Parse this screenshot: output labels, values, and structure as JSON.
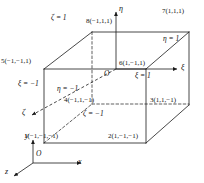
{
  "figure": {
    "type": "hexahedral-element-natural-coordinates",
    "origin_label": "O",
    "global_origin_label": "O"
  },
  "nodes": [
    {
      "id": "1",
      "label": "1(−1,−1,−1)",
      "x": -1,
      "y": -1,
      "z": -1
    },
    {
      "id": "2",
      "label": "2(1,−1,−1)",
      "x": 1,
      "y": -1,
      "z": -1
    },
    {
      "id": "3",
      "label": "3(1,1,−1)",
      "x": 1,
      "y": 1,
      "z": -1
    },
    {
      "id": "4",
      "label": "4(−1,1,−1)",
      "x": -1,
      "y": 1,
      "z": -1
    },
    {
      "id": "5",
      "label": "5(−1,−1,1)",
      "x": -1,
      "y": -1,
      "z": 1
    },
    {
      "id": "6",
      "label": "6(1,−1,1)",
      "x": 1,
      "y": -1,
      "z": 1
    },
    {
      "id": "7",
      "label": "7(1,1,1)",
      "x": 1,
      "y": 1,
      "z": 1
    },
    {
      "id": "8",
      "label": "8(−1,1,1)",
      "x": -1,
      "y": 1,
      "z": 1
    }
  ],
  "faces": [
    {
      "name": "zeta-top",
      "label": "ζ = 1"
    },
    {
      "name": "eta-right",
      "label": "η = 1"
    },
    {
      "name": "xi-right",
      "label": "ξ = 1"
    },
    {
      "name": "xi-left",
      "label": "ξ = −1"
    },
    {
      "name": "eta-front",
      "label": "η = −1"
    },
    {
      "name": "zeta-bottom",
      "label": "ζ = −1"
    }
  ],
  "natural_axes": [
    {
      "name": "xi",
      "label": "ξ"
    },
    {
      "name": "eta",
      "label": "η"
    },
    {
      "name": "zeta",
      "label": "ζ"
    }
  ],
  "global_axes": [
    {
      "name": "x",
      "label": "x"
    },
    {
      "name": "y",
      "label": "y"
    },
    {
      "name": "z",
      "label": "z"
    }
  ]
}
